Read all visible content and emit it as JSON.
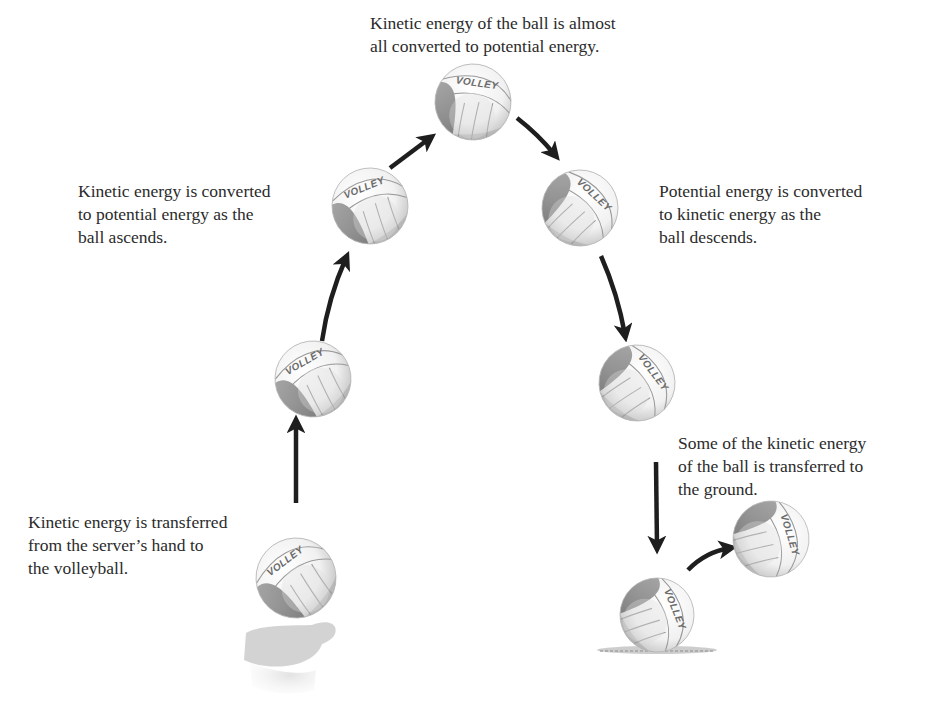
{
  "diagram": {
    "captions": {
      "serve": "Kinetic energy is transferred\nfrom the server’s hand to\nthe volleyball.",
      "ascend": "Kinetic energy is converted\nto potential energy as the\nball ascends.",
      "apex": "Kinetic energy of the ball is almost\nall converted to potential energy.",
      "descend": "Potential energy is converted\nto kinetic energy as the\nball descends.",
      "ground": "Some of the kinetic energy\nof the ball is transferred to\nthe ground."
    },
    "ball_label": "VOLLEY",
    "balls": [
      {
        "id": "serve",
        "cx": 296,
        "cy": 578,
        "r": 40,
        "rot": -25
      },
      {
        "id": "rise-1",
        "cx": 313,
        "cy": 379,
        "r": 38,
        "rot": -18
      },
      {
        "id": "rise-2",
        "cx": 370,
        "cy": 206,
        "r": 38,
        "rot": -10
      },
      {
        "id": "apex",
        "cx": 473,
        "cy": 102,
        "r": 38,
        "rot": 20
      },
      {
        "id": "fall-1",
        "cx": 580,
        "cy": 208,
        "r": 38,
        "rot": 55
      },
      {
        "id": "fall-2",
        "cx": 637,
        "cy": 383,
        "r": 38,
        "rot": 65
      },
      {
        "id": "ground",
        "cx": 657,
        "cy": 615,
        "r": 37,
        "rot": 80
      },
      {
        "id": "bounce",
        "cx": 771,
        "cy": 539,
        "r": 38,
        "rot": 85
      }
    ],
    "arrows": [
      {
        "from": [
          296,
          503
        ],
        "to": [
          296,
          422
        ],
        "curve": 0
      },
      {
        "from": [
          322,
          341
        ],
        "to": [
          346,
          258
        ],
        "curve": -6
      },
      {
        "from": [
          390,
          168
        ],
        "to": [
          430,
          138
        ],
        "curve": 0
      },
      {
        "from": [
          517,
          118
        ],
        "to": [
          555,
          155
        ],
        "curve": -3
      },
      {
        "from": [
          601,
          256
        ],
        "to": [
          625,
          335
        ],
        "curve": -5
      },
      {
        "from": [
          656,
          462
        ],
        "to": [
          657,
          547
        ],
        "curve": 0
      },
      {
        "from": [
          688,
          570
        ],
        "to": [
          730,
          548
        ],
        "curve": -8
      }
    ],
    "colors": {
      "ball_base": "#f4f4f4",
      "ball_panel_dark": "#8a8a8a",
      "ball_seam": "#9a9a9a",
      "arrow": "#1e1e1e",
      "text": "#2b2b2b",
      "hand": "#c9c9c9",
      "ground": "#9d9d9d"
    }
  }
}
